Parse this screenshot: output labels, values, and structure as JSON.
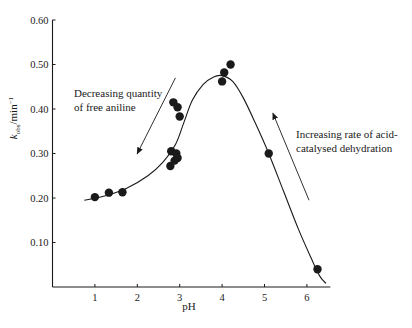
{
  "chart_data": {
    "type": "scatter",
    "title": "",
    "xlabel": "pH",
    "ylabel": "k_obs/min^-1",
    "ylabel_parts": {
      "k": "k",
      "sub": "obs",
      "unit": "/min",
      "sup": "−1"
    },
    "xlim": [
      0,
      6.6
    ],
    "ylim": [
      0,
      0.6
    ],
    "xticks": [
      1,
      2,
      3,
      4,
      5,
      6
    ],
    "xtick_labels": [
      "1",
      "2",
      "3",
      "4",
      "5",
      "6"
    ],
    "yticks": [
      0.1,
      0.2,
      0.3,
      0.4,
      0.5,
      0.6
    ],
    "ytick_labels": [
      "0.10",
      "0.20",
      "0.30",
      "0.40",
      "0.50",
      "0.60"
    ],
    "grid": false,
    "legend": null,
    "series": [
      {
        "name": "observed",
        "type": "scatter",
        "points": [
          {
            "x": 1.0,
            "y": 0.202
          },
          {
            "x": 1.33,
            "y": 0.212
          },
          {
            "x": 1.65,
            "y": 0.213
          },
          {
            "x": 2.85,
            "y": 0.415
          },
          {
            "x": 2.95,
            "y": 0.404
          },
          {
            "x": 3.0,
            "y": 0.383
          },
          {
            "x": 2.8,
            "y": 0.305
          },
          {
            "x": 2.92,
            "y": 0.3
          },
          {
            "x": 2.95,
            "y": 0.29
          },
          {
            "x": 2.88,
            "y": 0.284
          },
          {
            "x": 2.78,
            "y": 0.272
          },
          {
            "x": 4.0,
            "y": 0.462
          },
          {
            "x": 4.05,
            "y": 0.482
          },
          {
            "x": 4.2,
            "y": 0.5
          },
          {
            "x": 5.1,
            "y": 0.3
          },
          {
            "x": 6.25,
            "y": 0.04
          }
        ]
      },
      {
        "name": "fitted curve",
        "type": "line",
        "points": [
          {
            "x": 0.75,
            "y": 0.195
          },
          {
            "x": 1.25,
            "y": 0.205
          },
          {
            "x": 1.75,
            "y": 0.222
          },
          {
            "x": 2.25,
            "y": 0.25
          },
          {
            "x": 2.6,
            "y": 0.28
          },
          {
            "x": 2.9,
            "y": 0.32
          },
          {
            "x": 3.1,
            "y": 0.37
          },
          {
            "x": 3.3,
            "y": 0.42
          },
          {
            "x": 3.55,
            "y": 0.455
          },
          {
            "x": 3.8,
            "y": 0.472
          },
          {
            "x": 4.0,
            "y": 0.475
          },
          {
            "x": 4.25,
            "y": 0.462
          },
          {
            "x": 4.5,
            "y": 0.425
          },
          {
            "x": 4.8,
            "y": 0.365
          },
          {
            "x": 5.1,
            "y": 0.3
          },
          {
            "x": 5.45,
            "y": 0.215
          },
          {
            "x": 5.8,
            "y": 0.13
          },
          {
            "x": 6.1,
            "y": 0.065
          },
          {
            "x": 6.3,
            "y": 0.025
          },
          {
            "x": 6.45,
            "y": 0.008
          }
        ]
      }
    ],
    "annotations": [
      {
        "id": "left",
        "lines": [
          "Decreasing quantity",
          "of free aniline"
        ],
        "arrow": {
          "from": {
            "x": 2.9,
            "y": 0.47
          },
          "to": {
            "x": 2.0,
            "y": 0.3
          },
          "direction": "down-left"
        }
      },
      {
        "id": "right",
        "lines": [
          "Increasing rate of acid-",
          "catalysed dehydration"
        ],
        "arrow": {
          "from": {
            "x": 6.05,
            "y": 0.195
          },
          "to": {
            "x": 5.2,
            "y": 0.39
          },
          "direction": "up-left"
        }
      }
    ]
  },
  "colors": {
    "ink": "#1a1a1a",
    "background": "#ffffff"
  }
}
